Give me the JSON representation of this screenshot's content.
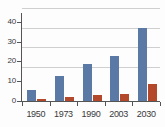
{
  "chart_data": {
    "type": "bar",
    "title": "",
    "subtitle": "",
    "xlabel": "",
    "ylabel": "",
    "categories": [
      "1950",
      "1973",
      "1990",
      "2003",
      "2030"
    ],
    "series": [
      {
        "name": "series-1",
        "color": "#5b79a5",
        "values": [
          5.5,
          12.8,
          18.6,
          23.0,
          37.0
        ]
      },
      {
        "name": "series-2",
        "color": "#b4482a",
        "values": [
          1.0,
          2.0,
          2.8,
          3.8,
          8.5
        ]
      }
    ],
    "ylim": [
      0,
      44
    ],
    "yticks": [
      0,
      10,
      20,
      30,
      40
    ],
    "ytick_labels": [
      "0",
      "10",
      "20",
      "30",
      "40"
    ],
    "grid": true,
    "grid_axis": "y",
    "legend": false,
    "legend_position": "none",
    "axis_color": "#555555",
    "grid_color": "#cfcfcf",
    "text_color": "#3a3a3a",
    "background": "#fdfdfd"
  }
}
